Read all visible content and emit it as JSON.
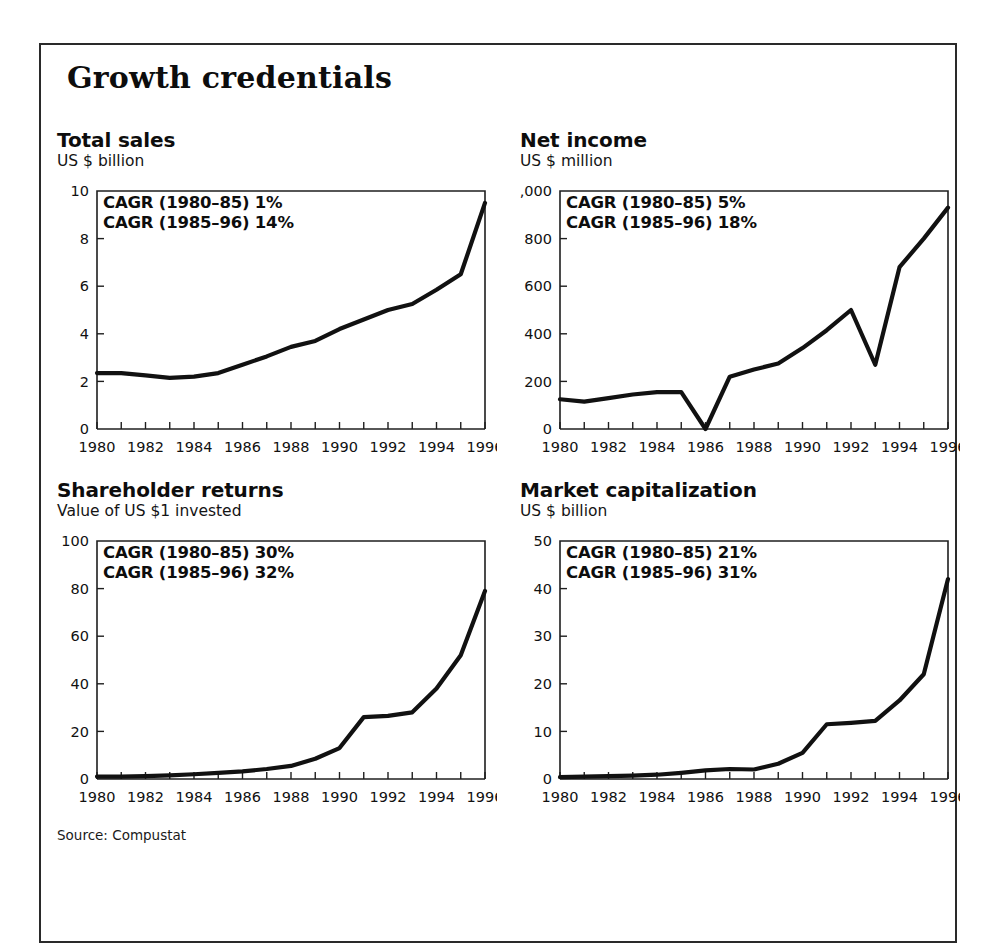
{
  "exhibit": {
    "title": "Growth credentials",
    "source_note": "Source: Compustat"
  },
  "panels": [
    {
      "id": "total-sales",
      "title": "Total sales",
      "subtitle": "US $ billion",
      "cagr_lines": [
        "CAGR (1980–85) 1%",
        "CAGR (1985–96) 14%"
      ]
    },
    {
      "id": "net-income",
      "title": "Net income",
      "subtitle": "US $ million",
      "cagr_lines": [
        "CAGR (1980–85) 5%",
        "CAGR (1985–96) 18%"
      ]
    },
    {
      "id": "shareholder-returns",
      "title": "Shareholder returns",
      "subtitle": "Value of US $1 invested",
      "cagr_lines": [
        "CAGR (1980–85) 30%",
        "CAGR (1985–96) 32%"
      ]
    },
    {
      "id": "market-capitalization",
      "title": "Market capitalization",
      "subtitle": "US $ billion",
      "cagr_lines": [
        "CAGR (1980–85) 21%",
        "CAGR (1985–96) 31%"
      ]
    }
  ],
  "chart_data": [
    {
      "type": "line",
      "title": "Total sales",
      "subtitle": "US $ billion",
      "xlabel": "",
      "ylabel": "US $ billion",
      "x": [
        1980,
        1981,
        1982,
        1983,
        1984,
        1985,
        1986,
        1987,
        1988,
        1989,
        1990,
        1991,
        1992,
        1993,
        1994,
        1995,
        1996
      ],
      "values": [
        2.35,
        2.35,
        2.25,
        2.15,
        2.2,
        2.35,
        2.7,
        3.05,
        3.45,
        3.7,
        4.2,
        4.6,
        5.0,
        5.25,
        5.85,
        6.5,
        9.5
      ],
      "xlim": [
        1980,
        1996
      ],
      "ylim": [
        0,
        10
      ],
      "yticks": [
        0,
        2,
        4,
        6,
        8,
        10
      ],
      "ytick_labels": [
        "0",
        "2",
        "4",
        "6",
        "8",
        "10"
      ],
      "xticks": [
        1980,
        1982,
        1984,
        1986,
        1988,
        1990,
        1992,
        1994,
        1996
      ],
      "xtick_labels": [
        "1980",
        "1982",
        "1984",
        "1986",
        "1988",
        "1990",
        "1992",
        "1994",
        "1996"
      ],
      "minor_xticks_every": 1,
      "grid": false,
      "legend": "none",
      "annotations": [
        "CAGR (1980–85) 1%",
        "CAGR (1985–96) 14%"
      ]
    },
    {
      "type": "line",
      "title": "Net income",
      "subtitle": "US $ million",
      "xlabel": "",
      "ylabel": "US $ million",
      "x": [
        1980,
        1981,
        1982,
        1983,
        1984,
        1985,
        1986,
        1987,
        1988,
        1989,
        1990,
        1991,
        1992,
        1993,
        1994,
        1995,
        1996
      ],
      "values": [
        125,
        115,
        130,
        145,
        155,
        155,
        0,
        220,
        250,
        275,
        340,
        415,
        500,
        270,
        680,
        800,
        930
      ],
      "xlim": [
        1980,
        1996
      ],
      "ylim": [
        0,
        1000
      ],
      "yticks": [
        0,
        200,
        400,
        600,
        800,
        1000
      ],
      "ytick_labels": [
        "0",
        "200",
        "400",
        "600",
        "800",
        "1,000"
      ],
      "xticks": [
        1980,
        1982,
        1984,
        1986,
        1988,
        1990,
        1992,
        1994,
        1996
      ],
      "xtick_labels": [
        "1980",
        "1982",
        "1984",
        "1986",
        "1988",
        "1990",
        "1992",
        "1994",
        "1996"
      ],
      "minor_xticks_every": 1,
      "grid": false,
      "legend": "none",
      "annotations": [
        "CAGR (1980–85) 5%",
        "CAGR (1985–96) 18%"
      ]
    },
    {
      "type": "line",
      "title": "Shareholder returns",
      "subtitle": "Value of US $1 invested",
      "xlabel": "",
      "ylabel": "Value of US $1 invested",
      "x": [
        1980,
        1981,
        1982,
        1983,
        1984,
        1985,
        1986,
        1987,
        1988,
        1989,
        1990,
        1991,
        1992,
        1993,
        1994,
        1995,
        1996
      ],
      "values": [
        1,
        1,
        1.2,
        1.5,
        2,
        2.6,
        3.2,
        4.2,
        5.5,
        8.5,
        13,
        26,
        26.5,
        28,
        38,
        52,
        79
      ],
      "xlim": [
        1980,
        1996
      ],
      "ylim": [
        0,
        100
      ],
      "yticks": [
        0,
        20,
        40,
        60,
        80,
        100
      ],
      "ytick_labels": [
        "0",
        "20",
        "40",
        "60",
        "80",
        "100"
      ],
      "xticks": [
        1980,
        1982,
        1984,
        1986,
        1988,
        1990,
        1992,
        1994,
        1996
      ],
      "xtick_labels": [
        "1980",
        "1982",
        "1984",
        "1986",
        "1988",
        "1990",
        "1992",
        "1994",
        "1996"
      ],
      "minor_xticks_every": 1,
      "grid": false,
      "legend": "none",
      "annotations": [
        "CAGR (1980–85) 30%",
        "CAGR (1985–96) 32%"
      ]
    },
    {
      "type": "line",
      "title": "Market capitalization",
      "subtitle": "US $ billion",
      "xlabel": "",
      "ylabel": "US $ billion",
      "x": [
        1980,
        1981,
        1982,
        1983,
        1984,
        1985,
        1986,
        1987,
        1988,
        1989,
        1990,
        1991,
        1992,
        1993,
        1994,
        1995,
        1996
      ],
      "values": [
        0.4,
        0.5,
        0.6,
        0.7,
        0.9,
        1.3,
        1.8,
        2.1,
        2.0,
        3.2,
        5.5,
        11.5,
        11.8,
        12.2,
        16.5,
        22,
        42
      ],
      "xlim": [
        1980,
        1996
      ],
      "ylim": [
        0,
        50
      ],
      "yticks": [
        0,
        10,
        20,
        30,
        40,
        50
      ],
      "ytick_labels": [
        "0",
        "10",
        "20",
        "30",
        "40",
        "50"
      ],
      "xticks": [
        1980,
        1982,
        1984,
        1986,
        1988,
        1990,
        1992,
        1994,
        1996
      ],
      "xtick_labels": [
        "1980",
        "1982",
        "1984",
        "1986",
        "1988",
        "1990",
        "1992",
        "1994",
        "1996"
      ],
      "minor_xticks_every": 1,
      "grid": false,
      "legend": "none",
      "annotations": [
        "CAGR (1980–85) 21%",
        "CAGR (1985–96) 31%"
      ]
    }
  ],
  "colors": {
    "line": "#111111",
    "axis": "#1f1f1f",
    "text": "#111111",
    "frame": "#2a2a2a",
    "background": "#ffffff"
  }
}
